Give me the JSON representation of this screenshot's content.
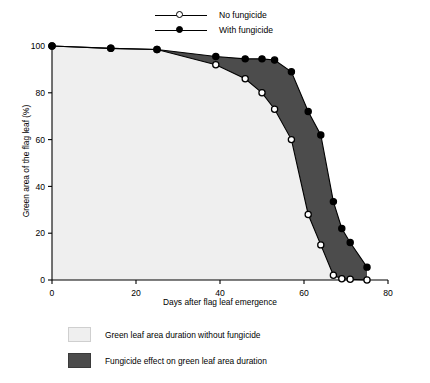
{
  "chart_data": {
    "type": "area",
    "title": "",
    "xlabel": "Days after flag leaf emergence",
    "ylabel": "Green area of the flag leaf (%)",
    "xlim": [
      0,
      80
    ],
    "ylim": [
      0,
      100
    ],
    "xticks": [
      0,
      20,
      40,
      60,
      80
    ],
    "yticks": [
      0,
      20,
      40,
      60,
      80,
      100
    ],
    "grid": false,
    "legend_position": "top-center",
    "series": [
      {
        "name": "No fungicide",
        "marker": "open-circle",
        "x": [
          0,
          14,
          25,
          39,
          46,
          50,
          53,
          57,
          61,
          64,
          67,
          69,
          71,
          75
        ],
        "values": [
          100,
          99,
          98.5,
          92,
          86,
          80,
          73,
          60,
          28,
          15,
          2,
          0.5,
          0.3,
          0
        ]
      },
      {
        "name": "With fungicide",
        "marker": "filled-circle",
        "x": [
          0,
          14,
          25,
          39,
          46,
          50,
          53,
          57,
          61,
          64,
          67,
          69,
          71,
          75
        ],
        "values": [
          100,
          99,
          98.5,
          95.5,
          94.5,
          94.5,
          94,
          89,
          72,
          62,
          33.5,
          22,
          16,
          5.5
        ]
      }
    ],
    "areas": [
      {
        "name": "Green leaf area duration without fungicide",
        "color": "#efefef",
        "under_series": "No fungicide"
      },
      {
        "name": "Fungicide effect on green leaf area duration",
        "color": "#4c4c4c",
        "between_series": [
          "No fungicide",
          "With fungicide"
        ]
      }
    ]
  },
  "series_legend": {
    "items": [
      {
        "label": "No fungicide",
        "marker": "open-circle"
      },
      {
        "label": "With fungicide",
        "marker": "filled-circle"
      }
    ]
  },
  "area_legend": {
    "items": [
      {
        "label": "Green leaf area duration without fungicide",
        "swatch": "light"
      },
      {
        "label": "Fungicide effect on green leaf area duration",
        "swatch": "dark"
      }
    ]
  },
  "axes": {
    "x_title": "Days after flag leaf emergence",
    "y_title": "Green area of the flag leaf (%)",
    "x_tick_labels": [
      "0",
      "20",
      "40",
      "60",
      "80"
    ],
    "y_tick_labels": [
      "0",
      "20",
      "40",
      "60",
      "80",
      "100"
    ]
  },
  "colors": {
    "light_area": "#efefef",
    "dark_area": "#4c4c4c",
    "axis": "#000000",
    "line": "#000000"
  }
}
